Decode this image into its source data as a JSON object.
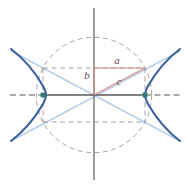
{
  "figure": {
    "kind": "hyperbola-geometry-diagram",
    "width": 189,
    "height": 188,
    "background": "#ffffff",
    "origin": {
      "x": 94,
      "y": 95
    }
  },
  "labels": {
    "a": "a",
    "b": "b",
    "c": "c"
  },
  "label_positions": {
    "a": {
      "x": 117,
      "y": 61
    },
    "b": {
      "x": 87,
      "y": 76
    },
    "c": {
      "x": 119,
      "y": 82
    }
  },
  "colors": {
    "curve": "#3b5f9e",
    "asymptote": "#b9cfe6",
    "triangle": "#d98a84",
    "dashed_gray": "#8a8a8a",
    "axis": "#595959",
    "focus_point": "#2d7b77",
    "label_text": "#6b4a48",
    "background": "#ffffff"
  },
  "chart_data": {
    "type": "line",
    "title": "",
    "xlabel": "",
    "ylabel": "",
    "curve_type": "hyperbola",
    "equation": "x^2/a^2 - y^2/b^2 = 1",
    "parameters": {
      "a": 51,
      "b": 27,
      "c": 57.7
    },
    "axis_ranges": {
      "xlim": [
        -94,
        95
      ],
      "ylim": [
        -93,
        95
      ]
    },
    "grid": false,
    "legend": "none",
    "elements": [
      {
        "name": "x-axis",
        "type": "axis-line",
        "style": "solid-with-dashed-extension",
        "from": {
          "x": -94,
          "y": 0
        },
        "to": {
          "x": 95,
          "y": 0
        }
      },
      {
        "name": "y-axis",
        "type": "axis-line",
        "style": "solid",
        "from": {
          "x": 0,
          "y": -93
        },
        "to": {
          "x": 0,
          "y": 95
        }
      },
      {
        "name": "hyperbola-right-branch",
        "type": "curve",
        "color": "#3b5f9e",
        "vertex": {
          "x": 51,
          "y": 0
        }
      },
      {
        "name": "hyperbola-left-branch",
        "type": "curve",
        "color": "#3b5f9e",
        "vertex": {
          "x": -51,
          "y": 0
        }
      },
      {
        "name": "asymptote-positive-slope",
        "type": "line",
        "color": "#b9cfe6",
        "slope": 0.529
      },
      {
        "name": "asymptote-negative-slope",
        "type": "line",
        "color": "#b9cfe6",
        "slope": -0.529
      },
      {
        "name": "reference-circle",
        "type": "circle",
        "radius": 57.7,
        "style": "dashed",
        "color": "#8a8a8a"
      },
      {
        "name": "fundamental-rectangle",
        "type": "rect",
        "half_width": 51,
        "half_height": 27,
        "style": "dashed",
        "color": "#8a8a8a"
      },
      {
        "name": "triangle-leg-a",
        "type": "segment",
        "color": "#d98a84",
        "from": {
          "x": 0,
          "y": 27
        },
        "to": {
          "x": 51,
          "y": 27
        },
        "label": "a"
      },
      {
        "name": "triangle-leg-b",
        "type": "segment",
        "color": "#d98a84",
        "from": {
          "x": 0,
          "y": 0
        },
        "to": {
          "x": 0,
          "y": 27
        },
        "label": "b"
      },
      {
        "name": "triangle-hypotenuse-c",
        "type": "segment",
        "color": "#d98a84",
        "from": {
          "x": 0,
          "y": 0
        },
        "to": {
          "x": 51,
          "y": 27
        },
        "label": "c"
      },
      {
        "name": "focus-right",
        "type": "point",
        "color": "#2d7b77",
        "at": {
          "x": 51,
          "y": 0
        }
      },
      {
        "name": "focus-left",
        "type": "point",
        "color": "#2d7b77",
        "at": {
          "x": -51,
          "y": 0
        }
      }
    ]
  }
}
